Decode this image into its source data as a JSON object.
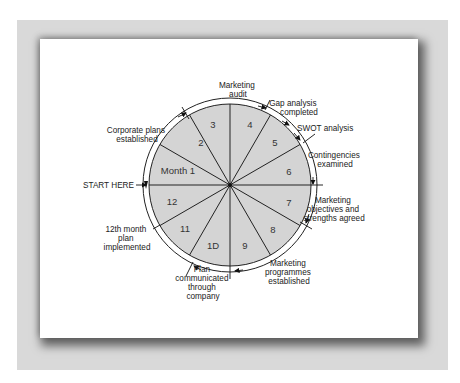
{
  "diagram": {
    "type": "annual-marketing-planning-cycle",
    "center": {
      "x": 230,
      "y": 185
    },
    "inner_radius": 81,
    "outer_radius": 87,
    "colors": {
      "frame": "#d9d9d9",
      "wedge_fill": "#d4d4d4",
      "ring_fill": "#ffffff",
      "lines": "#222222"
    },
    "segments": [
      {
        "label": "Month 1"
      },
      {
        "label": "2"
      },
      {
        "label": "3"
      },
      {
        "label": "4"
      },
      {
        "label": "5"
      },
      {
        "label": "6"
      },
      {
        "label": "7"
      },
      {
        "label": "8"
      },
      {
        "label": "9"
      },
      {
        "label": "1D"
      },
      {
        "label": "11"
      },
      {
        "label": "12"
      }
    ],
    "milestones": [
      {
        "lines": [
          "Marketing",
          "audit"
        ]
      },
      {
        "lines": [
          "Gap analysis",
          "completed"
        ]
      },
      {
        "lines": [
          "SWOT analysis"
        ]
      },
      {
        "lines": [
          "Contingencies",
          "examined"
        ]
      },
      {
        "lines": [
          "Marketing",
          "objectives and",
          "strengths agreed"
        ]
      },
      {
        "lines": [
          "Marketing",
          "programmes",
          "established"
        ]
      },
      {
        "lines": [
          "Plan",
          "communicated",
          "through",
          "company"
        ]
      },
      {
        "lines": [
          "12th month",
          "plan",
          "implemented"
        ]
      },
      {
        "lines": [
          "START HERE"
        ]
      },
      {
        "lines": [
          "Corporate plans",
          "established"
        ]
      }
    ]
  }
}
